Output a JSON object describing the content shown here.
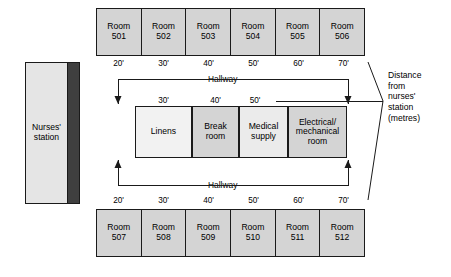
{
  "diagram": {
    "nurses_station": {
      "label": "Nurses'\nstation"
    },
    "annotation": {
      "text": "Distance\nfrom\nnurses'\nstation\n(metres)"
    },
    "hallway": {
      "top_label": "Hallway",
      "bottom_label": "Hallway"
    },
    "top_rooms": [
      {
        "label": "Room\n501",
        "distance": "20'"
      },
      {
        "label": "Room\n502",
        "distance": "30'"
      },
      {
        "label": "Room\n503",
        "distance": "40'"
      },
      {
        "label": "Room\n504",
        "distance": "50'"
      },
      {
        "label": "Room\n505",
        "distance": "60'"
      },
      {
        "label": "Room\n506",
        "distance": "70'"
      }
    ],
    "bottom_rooms": [
      {
        "label": "Room\n507",
        "distance": "20'"
      },
      {
        "label": "Room\n508",
        "distance": "30'"
      },
      {
        "label": "Room\n509",
        "distance": "40'"
      },
      {
        "label": "Room\n510",
        "distance": "50'"
      },
      {
        "label": "Room\n511",
        "distance": "60'"
      },
      {
        "label": "Room\n512",
        "distance": "70'"
      }
    ],
    "center_rooms": [
      {
        "label": "Linens",
        "distance": "30'",
        "fill": "#f2f2f2"
      },
      {
        "label": "Break\nroom",
        "distance": "40'",
        "fill": "#d4d4d4"
      },
      {
        "label": "Medical\nsupply",
        "distance": "50'",
        "fill": "#ebebeb"
      },
      {
        "label": "Electrical/\nmechanical\nroom",
        "distance": "",
        "fill": "#d4d4d4"
      }
    ],
    "colors": {
      "room_fill": "#d4d4d4",
      "station_fill": "#e5e5e5",
      "station_bar": "#3f3f3f",
      "line": "#1a1a1a",
      "background": "#ffffff"
    }
  }
}
